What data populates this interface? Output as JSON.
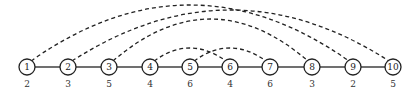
{
  "diagram": {
    "type": "graph",
    "colors": {
      "stroke": "#222222",
      "fill": "#ffffff",
      "text": "#222222"
    },
    "nodes": [
      {
        "id": "1",
        "x": 27,
        "weight": "2"
      },
      {
        "id": "2",
        "x": 68,
        "weight": "3"
      },
      {
        "id": "3",
        "x": 109,
        "weight": "5"
      },
      {
        "id": "4",
        "x": 150,
        "weight": "4"
      },
      {
        "id": "5",
        "x": 190,
        "weight": "6"
      },
      {
        "id": "6",
        "x": 230,
        "weight": "4"
      },
      {
        "id": "7",
        "x": 270,
        "weight": "6"
      },
      {
        "id": "8",
        "x": 312,
        "weight": "3"
      },
      {
        "id": "9",
        "x": 353,
        "weight": "2"
      },
      {
        "id": "10",
        "x": 393,
        "weight": "5"
      }
    ],
    "path_edges": [
      [
        "1",
        "2"
      ],
      [
        "2",
        "3"
      ],
      [
        "3",
        "4"
      ],
      [
        "4",
        "5"
      ],
      [
        "5",
        "6"
      ],
      [
        "6",
        "7"
      ],
      [
        "7",
        "8"
      ],
      [
        "8",
        "9"
      ],
      [
        "9",
        "10"
      ]
    ],
    "dashed_arcs": [
      {
        "from": "1",
        "to": "9",
        "peak_y": 5
      },
      {
        "from": "2",
        "to": "10",
        "peak_y": 10
      },
      {
        "from": "3",
        "to": "8",
        "peak_y": 19
      },
      {
        "from": "4",
        "to": "6",
        "peak_y": 48
      },
      {
        "from": "5",
        "to": "7",
        "peak_y": 48
      }
    ]
  }
}
